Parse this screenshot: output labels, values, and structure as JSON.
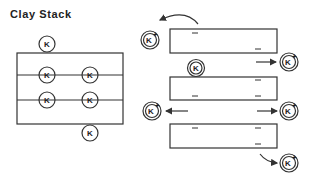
{
  "title": "Clay Stack",
  "left_diagram": {
    "label": "K",
    "ions": [
      {
        "cx": 47,
        "cy": 44
      },
      {
        "cx": 47,
        "cy": 75
      },
      {
        "cx": 90,
        "cy": 75
      },
      {
        "cx": 47,
        "cy": 100
      },
      {
        "cx": 90,
        "cy": 100
      },
      {
        "cx": 90,
        "cy": 133
      }
    ]
  },
  "right_diagram": {
    "plate_charge": "–",
    "bound_ion_label": "K",
    "hydrated_ion_label": "K",
    "hydrated_ion_charge": "+"
  }
}
